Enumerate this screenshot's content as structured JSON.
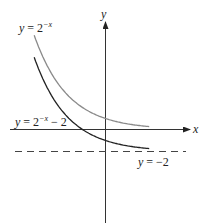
{
  "chart_data": {
    "type": "line",
    "title": "",
    "xlabel": "x",
    "ylabel": "y",
    "series": [
      {
        "name": "y = 2^-x",
        "label_base": "y = 2",
        "label_exp": "−x",
        "label_suffix": "",
        "color": "#8a8a8a",
        "x_range": [
          -3.1,
          1.9
        ]
      },
      {
        "name": "y = 2^-x - 2",
        "label_base": "y = 2",
        "label_exp": "−x",
        "label_suffix": " − 2",
        "color": "#222222",
        "x_range": [
          -3.1,
          1.9
        ]
      }
    ],
    "asymptote": {
      "label": "y = −2",
      "y": -2,
      "style": "dashed"
    },
    "grid": false
  },
  "axes": {
    "x_label": "x",
    "y_label": "y"
  }
}
